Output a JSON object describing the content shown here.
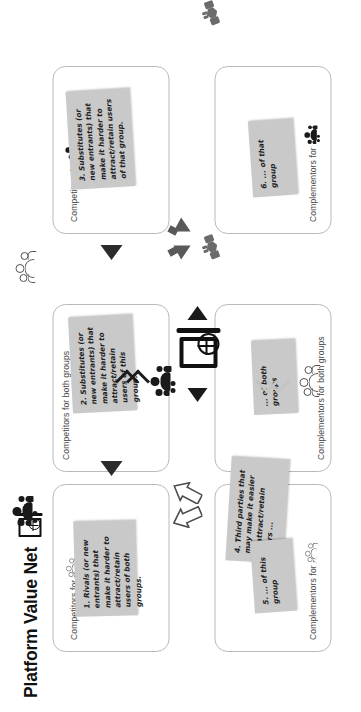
{
  "title": "Platform Value Net",
  "legend": {
    "platform_icon": "platform-screen-globe-icon",
    "group_a_icon": "user-group-dark-icon",
    "group_b_icon": "user-group-outline-icon"
  },
  "panels": [
    {
      "id": "competitors-group-b",
      "label": "Competitors for",
      "icon": "user-group-dark-icon",
      "note_id": "note-3"
    },
    {
      "id": "competitors-both",
      "label": "Competitors for both groups",
      "icon": null,
      "note_id": "note-1"
    },
    {
      "id": "competitors-group-a",
      "label": "Competitors for",
      "icon": "user-group-outline-icon",
      "note_id": "note-2"
    },
    {
      "id": "complementors-group-b",
      "label": "Complementors for",
      "icon": "user-group-dark-icon",
      "note_id": "note-6"
    },
    {
      "id": "complementors-both",
      "label": "Complementors for both groups",
      "icon": null,
      "note_id": "note-5"
    },
    {
      "id": "complementors-group-a",
      "label": "Complementors for",
      "icon": "user-group-outline-icon",
      "note_id": "note-4"
    }
  ],
  "notes": {
    "note_1": "1. Rivals (or new entrants) that make it harder to attract/retain users of both groups.",
    "note_2": "2. Substitutes (or new entrants) that make it harder to attract/retain users of this group.",
    "note_3": "3. Substitutes (or new entrants) that make it harder to attract/retain users of that group.",
    "note_4": "4. Third parties that may make it easier to attract/retain users ...",
    "note_5": "... of both groups",
    "note_6": "6. ... of that group",
    "note_7": "5. ... of this group"
  },
  "colors": {
    "note_bg": "#c9c9c9",
    "panel_border": "#b9b9b9",
    "arrow_dark": "#1a1a1a",
    "arrow_grey": "#595959",
    "chevron_light": "#c2c2c2",
    "text": "#1f1f1f",
    "label_text": "#4a4a4a"
  }
}
